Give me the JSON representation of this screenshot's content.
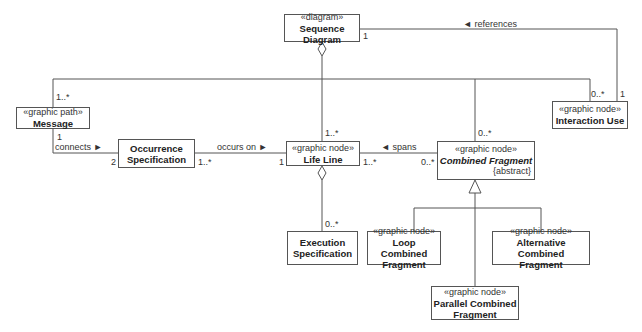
{
  "classes": {
    "sequence_diagram": {
      "stereotype": "«diagram»",
      "name": "Sequence Diagram"
    },
    "message": {
      "stereotype": "«graphic path»",
      "name": "Message"
    },
    "interaction_use": {
      "stereotype": "«graphic node»",
      "name": "Interaction Use"
    },
    "occurrence_specification": {
      "name_line1": "Occurrence",
      "name_line2": "Specification"
    },
    "life_line": {
      "stereotype": "«graphic node»",
      "name": "Life Line"
    },
    "combined_fragment": {
      "stereotype": "«graphic node»",
      "name": "Combined Fragment",
      "constraint": "{abstract}"
    },
    "execution_specification": {
      "name_line1": "Execution",
      "name_line2": "Specification"
    },
    "loop_combined_fragment": {
      "stereotype": "«graphic node»",
      "name_line1": "Loop Combined",
      "name_line2": "Fragment"
    },
    "alternative_combined_fragment": {
      "stereotype": "«graphic node»",
      "name_line1": "Alternative Combined",
      "name_line2": "Fragment"
    },
    "parallel_combined_fragment": {
      "stereotype": "«graphic node»",
      "name_line1": "Parallel Combined",
      "name_line2": "Fragment"
    }
  },
  "associations": {
    "references": {
      "label": "◄ references",
      "mult_diagram": "1",
      "mult_interaction": "1"
    },
    "bus": {
      "mult_message": "1..*",
      "mult_lifeline": "1..*",
      "mult_combined": "0..*",
      "mult_interaction": "0..*"
    },
    "connects": {
      "label": "connects ►",
      "mult_message": "1",
      "mult_occurrence": "2"
    },
    "occurs_on": {
      "label": "occurs on ►",
      "mult_occurrence": "1..*",
      "mult_lifeline": "1"
    },
    "spans": {
      "label": "◄ spans",
      "mult_lifeline": "1..*",
      "mult_combined": "0..*"
    },
    "execution": {
      "mult_execution": "0..*"
    }
  }
}
